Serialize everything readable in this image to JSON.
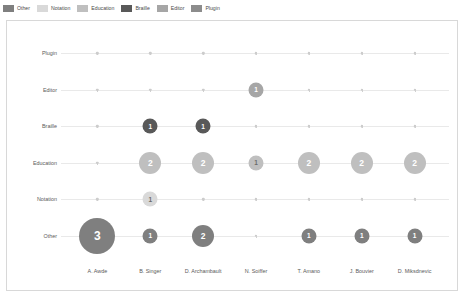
{
  "legend": {
    "position": "top-left",
    "items": [
      {
        "label": "Other",
        "color": "#7f7f7f"
      },
      {
        "label": "Notation",
        "color": "#d9d9d9"
      },
      {
        "label": "Education",
        "color": "#bfbfbf"
      },
      {
        "label": "Braille",
        "color": "#595959"
      },
      {
        "label": "Editor",
        "color": "#a6a6a6"
      },
      {
        "label": "Plugin",
        "color": "#8c8c8c"
      }
    ]
  },
  "chart_data": {
    "type": "scatter",
    "title": "",
    "xlabel": "",
    "ylabel": "",
    "grid": true,
    "legend_position": "top-left",
    "categories": [
      "A. Awde",
      "B. Singer",
      "D. Archambault",
      "N. Soiffer",
      "T. Amano",
      "J. Bouvier",
      "D. Miksdnevic"
    ],
    "y_categories": [
      "Plugin",
      "Editor",
      "Braille",
      "Education",
      "Notation",
      "Other"
    ],
    "series": [
      {
        "name": "Plugin",
        "color": "#8c8c8c",
        "points": [
          {
            "x": "A. Awde",
            "value": 0
          },
          {
            "x": "B. Singer",
            "value": 0
          },
          {
            "x": "D. Archambault",
            "value": 0
          },
          {
            "x": "N. Soiffer",
            "value": 0
          },
          {
            "x": "T. Amano",
            "value": 0
          },
          {
            "x": "J. Bouvier",
            "value": 0
          },
          {
            "x": "D. Miksdnevic",
            "value": 0
          }
        ]
      },
      {
        "name": "Editor",
        "color": "#a6a6a6",
        "points": [
          {
            "x": "A. Awde",
            "value": 0
          },
          {
            "x": "B. Singer",
            "value": 0
          },
          {
            "x": "D. Archambault",
            "value": 0
          },
          {
            "x": "N. Soiffer",
            "value": 1
          },
          {
            "x": "T. Amano",
            "value": 0
          },
          {
            "x": "J. Bouvier",
            "value": 0
          },
          {
            "x": "D. Miksdnevic",
            "value": 0
          }
        ]
      },
      {
        "name": "Braille",
        "color": "#595959",
        "points": [
          {
            "x": "A. Awde",
            "value": 0
          },
          {
            "x": "B. Singer",
            "value": 1
          },
          {
            "x": "D. Archambault",
            "value": 1
          },
          {
            "x": "N. Soiffer",
            "value": 0
          },
          {
            "x": "T. Amano",
            "value": 0
          },
          {
            "x": "J. Bouvier",
            "value": 0
          },
          {
            "x": "D. Miksdnevic",
            "value": 0
          }
        ]
      },
      {
        "name": "Education",
        "color": "#bfbfbf",
        "points": [
          {
            "x": "A. Awde",
            "value": 0
          },
          {
            "x": "B. Singer",
            "value": 2
          },
          {
            "x": "D. Archambault",
            "value": 2
          },
          {
            "x": "N. Soiffer",
            "value": 1
          },
          {
            "x": "T. Amano",
            "value": 2
          },
          {
            "x": "J. Bouvier",
            "value": 2
          },
          {
            "x": "D. Miksdnevic",
            "value": 2
          }
        ]
      },
      {
        "name": "Notation",
        "color": "#d9d9d9",
        "points": [
          {
            "x": "A. Awde",
            "value": 0
          },
          {
            "x": "B. Singer",
            "value": 1
          },
          {
            "x": "D. Archambault",
            "value": 0
          },
          {
            "x": "N. Soiffer",
            "value": 0
          },
          {
            "x": "T. Amano",
            "value": 0
          },
          {
            "x": "J. Bouvier",
            "value": 0
          },
          {
            "x": "D. Miksdnevic",
            "value": 0
          }
        ]
      },
      {
        "name": "Other",
        "color": "#7f7f7f",
        "points": [
          {
            "x": "A. Awde",
            "value": 3
          },
          {
            "x": "B. Singer",
            "value": 1
          },
          {
            "x": "D. Archambault",
            "value": 2
          },
          {
            "x": "N. Soiffer",
            "value": 0
          },
          {
            "x": "T. Amano",
            "value": 1
          },
          {
            "x": "J. Bouvier",
            "value": 1
          },
          {
            "x": "D. Miksdnevic",
            "value": 1
          }
        ]
      }
    ]
  }
}
